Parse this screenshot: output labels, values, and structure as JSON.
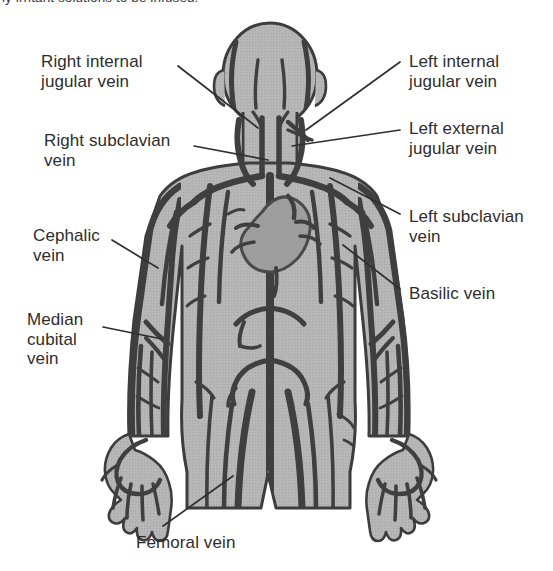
{
  "figure": {
    "caption_partial": "ly irritant solutions to be infused.",
    "colors": {
      "body_fill": "#b3b3b3",
      "body_outline": "#3d3d3d",
      "vein_stroke": "#3f3f3f",
      "vein_fine": "#4f4f4f",
      "heart_fill": "#9a9a9a",
      "label_text": "#2d2d2d",
      "leader_line": "#2f2f2f",
      "background": "#ffffff"
    }
  },
  "labels": [
    {
      "id": "right-internal-jugular-vein",
      "text": "Right internal\njugular vein",
      "side": "left",
      "x": 41,
      "y": 52
    },
    {
      "id": "right-subclavian-vein",
      "text": "Right subclavian\nvein",
      "side": "left",
      "x": 44,
      "y": 131
    },
    {
      "id": "cephalic-vein",
      "text": "Cephalic\nvein",
      "side": "left",
      "x": 33,
      "y": 226
    },
    {
      "id": "median-cubital-vein",
      "text": "Median\ncubital\nvein",
      "side": "left",
      "x": 27,
      "y": 310
    },
    {
      "id": "left-internal-jugular-vein",
      "text": "Left internal\njugular vein",
      "side": "right",
      "x": 409,
      "y": 52
    },
    {
      "id": "left-external-jugular-vein",
      "text": "Left external\njugular vein",
      "side": "right",
      "x": 409,
      "y": 119
    },
    {
      "id": "left-subclavian-vein",
      "text": "Left subclavian\nvein",
      "side": "right",
      "x": 409,
      "y": 207
    },
    {
      "id": "basilic-vein",
      "text": "Basilic vein",
      "side": "right",
      "x": 409,
      "y": 284
    },
    {
      "id": "femoral-vein",
      "text": "Femoral vein",
      "side": "bottom",
      "x": 136,
      "y": 533
    }
  ],
  "veins_depicted": [
    "right internal jugular vein",
    "left internal jugular vein",
    "left external jugular vein",
    "right subclavian vein",
    "left subclavian vein",
    "superior vena cava",
    "cephalic vein",
    "basilic vein",
    "median cubital vein",
    "femoral vein",
    "great saphenous vein"
  ]
}
